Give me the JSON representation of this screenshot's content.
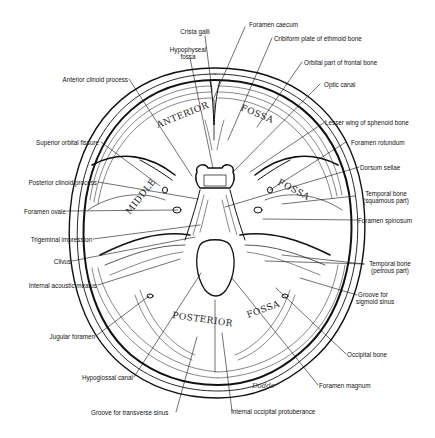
{
  "figure": {
    "fossa_labels": {
      "anterior_left": "ANTERIOR",
      "anterior_right": "FOSSA",
      "middle_left": "MIDDLE",
      "middle_right": "FOSSA",
      "posterior_left": "POSTERIOR",
      "posterior_right": "FOSSA"
    },
    "signature": "Dodds"
  },
  "labels": {
    "crista_galli": "Crista galli",
    "foramen_caecum": "Foramen caecum",
    "hypophyseal_fossa_1": "Hypophyseal",
    "hypophyseal_fossa_2": "fossa",
    "cribiform_plate": "Cribiform plate of ethmoid bone",
    "orbital_part": "Orbital part of frontal bone",
    "anterior_clinoid": "Anterior clinoid process",
    "optic_canal": "Optic canal",
    "lesser_wing": "Lesser wing of sphenoid bone",
    "superior_orbital_fissure": "Superior orbital fissure",
    "foramen_rotundum": "Foramen rotundum",
    "posterior_clinoid": "Posterior clinoid process",
    "dorsum_sellae": "Dorsum sellae",
    "temporal_squamous_1": "Temporal bone",
    "temporal_squamous_2": "(squamous part)",
    "foramen_ovale": "Foramen ovale",
    "foramen_spinosum": "Foramen spinosum",
    "trigeminal_impression": "Trigeminal impression",
    "clivus": "Clivus",
    "temporal_petrous_1": "Temporal bone",
    "temporal_petrous_2": "(petrous part)",
    "internal_acoustic_meatus": "Internal acoustic meatus",
    "groove_sigmoid_1": "Groove for",
    "groove_sigmoid_2": "sigmoid sinus",
    "jugular_foramen": "Jugular foramen",
    "occipital_bone": "Occipital bone",
    "hypoglossal_canal": "Hypoglossal canal",
    "foramen_magnum": "Foramen magnum",
    "groove_transverse": "Groove for transverse sinus",
    "internal_occipital_protuberance": "Internal occipital protuberance"
  }
}
